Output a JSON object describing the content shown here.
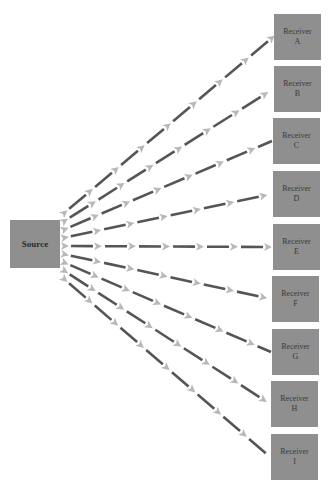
{
  "diagram": {
    "type": "broadcast-fan-out",
    "source": {
      "label": "Source"
    },
    "receivers": [
      {
        "id": "A",
        "line1": "Receiver",
        "line2": "A"
      },
      {
        "id": "B",
        "line1": "Receiver",
        "line2": "B"
      },
      {
        "id": "C",
        "line1": "Receiver",
        "line2": "C"
      },
      {
        "id": "D",
        "line1": "Receiver",
        "line2": "D"
      },
      {
        "id": "E",
        "line1": "Receiver",
        "line2": "E"
      },
      {
        "id": "F",
        "line1": "Receiver",
        "line2": "F"
      },
      {
        "id": "G",
        "line1": "Receiver",
        "line2": "G"
      },
      {
        "id": "H",
        "line1": "Receiver",
        "line2": "H"
      },
      {
        "id": "I",
        "line1": "Receiver",
        "line2": "I"
      }
    ],
    "edges": [
      {
        "from": "Source",
        "to": "Receiver A"
      },
      {
        "from": "Source",
        "to": "Receiver B"
      },
      {
        "from": "Source",
        "to": "Receiver C"
      },
      {
        "from": "Source",
        "to": "Receiver D"
      },
      {
        "from": "Source",
        "to": "Receiver E"
      },
      {
        "from": "Source",
        "to": "Receiver F"
      },
      {
        "from": "Source",
        "to": "Receiver G"
      },
      {
        "from": "Source",
        "to": "Receiver H"
      },
      {
        "from": "Source",
        "to": "Receiver I"
      }
    ],
    "colors": {
      "node_fill": "#8f8f8f",
      "dash": "#555555",
      "arrowhead": "#b8b8b8",
      "background": "#ffffff"
    }
  }
}
